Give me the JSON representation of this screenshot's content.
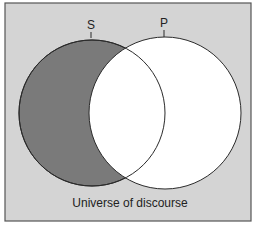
{
  "diagram": {
    "type": "venn",
    "colors": {
      "background": "#d4d4d4",
      "shaded": "#7a7a7a",
      "unshaded": "#ffffff",
      "stroke": "#2a2a2a"
    },
    "circles": [
      {
        "label": "S",
        "shaded": "S-only region"
      },
      {
        "label": "P",
        "shaded": "none"
      }
    ],
    "caption": "Universe of discourse"
  }
}
